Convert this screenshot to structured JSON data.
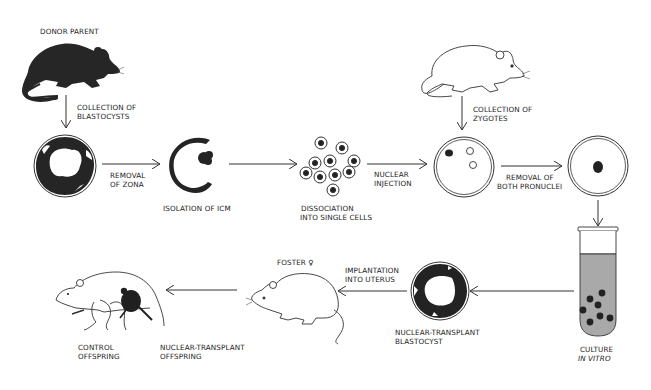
{
  "figure": {
    "colors": {
      "ink": "#1e1e1e",
      "background": "#ffffff",
      "culture_medium": "#a9a9a9"
    },
    "labels": {
      "donor_parent": "DONOR PARENT",
      "collection_blastocysts_1": "COLLECTION OF",
      "collection_blastocysts_2": "BLASTOCYSTS",
      "removal_zona_1": "REMOVAL",
      "removal_zona_2": "OF ZONA",
      "isolation_icm": "ISOLATION OF ICM",
      "dissociation_1": "DISSOCIATION",
      "dissociation_2": "INTO SINGLE CELLS",
      "nuclear_injection_1": "NUCLEAR",
      "nuclear_injection_2": "INJECTION",
      "collection_zygotes_1": "COLLECTION OF",
      "collection_zygotes_2": "ZYGOTES",
      "removal_pronuclei_1": "REMOVAL OF",
      "removal_pronuclei_2": "BOTH PRONUCLEI",
      "culture_1": "CULTURE",
      "culture_2": "IN VITRO",
      "nt_blastocyst_1": "NUCLEAR-TRANSPLANT",
      "nt_blastocyst_2": "BLASTOCYST",
      "implantation_1": "IMPLANTATION",
      "implantation_2": "INTO UTERUS",
      "foster": "FOSTER ♀",
      "nt_offspring_1": "NUCLEAR-TRANSPLANT",
      "nt_offspring_2": "OFFSPRING",
      "control_offspring_1": "CONTROL",
      "control_offspring_2": "OFFSPRING"
    },
    "nodes": [
      {
        "id": "donor-parent",
        "kind": "mouse",
        "fill": "dark"
      },
      {
        "id": "blastocyst",
        "kind": "blastocyst-with-zona"
      },
      {
        "id": "icm-isolated",
        "kind": "trophectoderm-ring-with-icm"
      },
      {
        "id": "single-cells",
        "kind": "cell-cluster",
        "count": 10
      },
      {
        "id": "zygote-mouse",
        "kind": "mouse",
        "fill": "outline"
      },
      {
        "id": "zygote-injected",
        "kind": "zygote",
        "nuclei": [
          "donor",
          "pronucleus",
          "pronucleus"
        ]
      },
      {
        "id": "zygote-enucleated",
        "kind": "zygote",
        "nuclei": [
          "donor"
        ]
      },
      {
        "id": "culture-tube",
        "kind": "test-tube",
        "embryos": 8
      },
      {
        "id": "nt-blastocyst",
        "kind": "blastocyst-with-zona"
      },
      {
        "id": "foster-mouse",
        "kind": "mouse",
        "fill": "outline"
      },
      {
        "id": "offspring-group",
        "kind": "mother-with-pups"
      }
    ]
  }
}
